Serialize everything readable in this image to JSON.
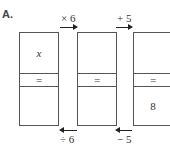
{
  "label": "A.",
  "boxes": [
    {
      "top": "x",
      "middle": "=",
      "bottom": ""
    },
    {
      "top": "",
      "middle": "=",
      "bottom": ""
    },
    {
      "top": "",
      "middle": "=",
      "bottom": "8"
    }
  ],
  "forward_ops": [
    "× 6",
    "+ 5"
  ],
  "inverse_ops": [
    "÷ 6",
    "− 5"
  ]
}
